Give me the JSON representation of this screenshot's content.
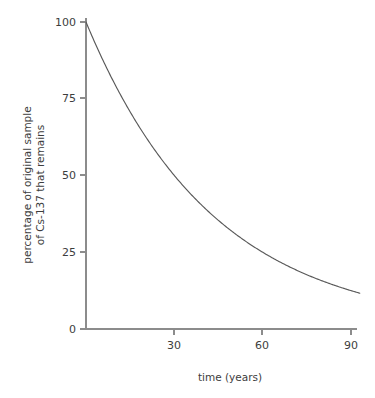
{
  "chart_data": {
    "type": "line",
    "title": "",
    "xlabel": "time (years)",
    "ylabel_line1": "percentage of original sample",
    "ylabel_line2": "of Cs-137 that remains",
    "ylabel": "percentage of original sample of Cs-137 that remains",
    "xlim": [
      0,
      93
    ],
    "ylim": [
      0,
      103
    ],
    "xticks": [
      30,
      60,
      90
    ],
    "xticklabels": [
      "30",
      "60",
      "90"
    ],
    "yticks": [
      0,
      25,
      50,
      75,
      100
    ],
    "yticklabels": [
      "0",
      "25",
      "50",
      "75",
      "100"
    ],
    "grid": false,
    "legend": false,
    "legend_position": "none",
    "series": [
      {
        "name": "Cs-137 remaining",
        "half_life_years": 30,
        "x": [
          0,
          5,
          10,
          15,
          20,
          25,
          30,
          35,
          40,
          45,
          50,
          55,
          60,
          65,
          70,
          75,
          80,
          85,
          90,
          93
        ],
        "values": [
          100,
          89.1,
          79.4,
          70.7,
          63,
          56.1,
          50,
          44.5,
          39.7,
          35.4,
          31.5,
          28.1,
          25,
          22.3,
          19.8,
          17.7,
          15.7,
          14,
          12.5,
          11.6
        ]
      }
    ],
    "annotations": [],
    "colors": {
      "curve": "#595959",
      "axis": "#8c8c8c",
      "text": "#3d3d3d",
      "background": "#ffffff"
    }
  }
}
